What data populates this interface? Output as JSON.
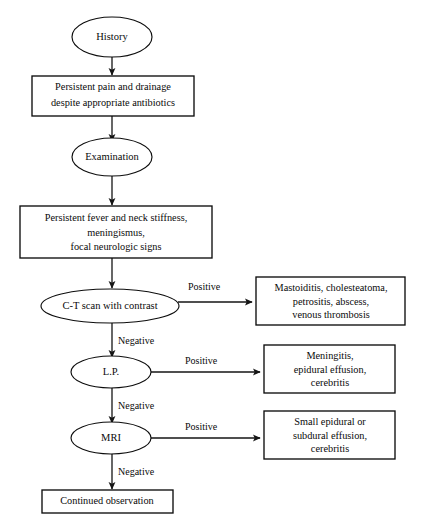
{
  "figure": {
    "background_color": "#ffffff",
    "line_color": "#151515",
    "text_color": "#0a0a0a"
  },
  "nodes": {
    "history": {
      "label": "History",
      "shape": "ellipse"
    },
    "persistent_pain": {
      "shape": "box",
      "lines": [
        "Persistent pain and drainage",
        "despite appropriate antibiotics"
      ]
    },
    "examination": {
      "label": "Examination",
      "shape": "ellipse"
    },
    "persistent_fever": {
      "shape": "box",
      "lines": [
        "Persistent fever and neck stiffness,",
        "meningismus,",
        "focal neurologic signs"
      ]
    },
    "ct_scan": {
      "label": "C-T scan with contrast",
      "shape": "ellipse"
    },
    "ct_positive_result": {
      "shape": "box",
      "lines": [
        "Mastoiditis, cholesteatoma,",
        "petrositis, abscess,",
        "venous thrombosis"
      ]
    },
    "lp": {
      "label": "L.P.",
      "shape": "ellipse"
    },
    "lp_positive_result": {
      "shape": "box",
      "lines": [
        "Meningitis,",
        "epidural effusion,",
        "cerebritis"
      ]
    },
    "mri": {
      "label": "MRI",
      "shape": "ellipse"
    },
    "mri_positive_result": {
      "shape": "box",
      "lines": [
        "Small epidural or",
        "subdural effusion,",
        "cerebritis"
      ]
    },
    "continued_observation": {
      "label": "Continued observation",
      "shape": "box"
    }
  },
  "edge_labels": {
    "ct_positive": "Positive",
    "ct_negative": "Negative",
    "lp_positive": "Positive",
    "lp_negative": "Negative",
    "mri_positive": "Positive",
    "mri_negative": "Negative"
  }
}
